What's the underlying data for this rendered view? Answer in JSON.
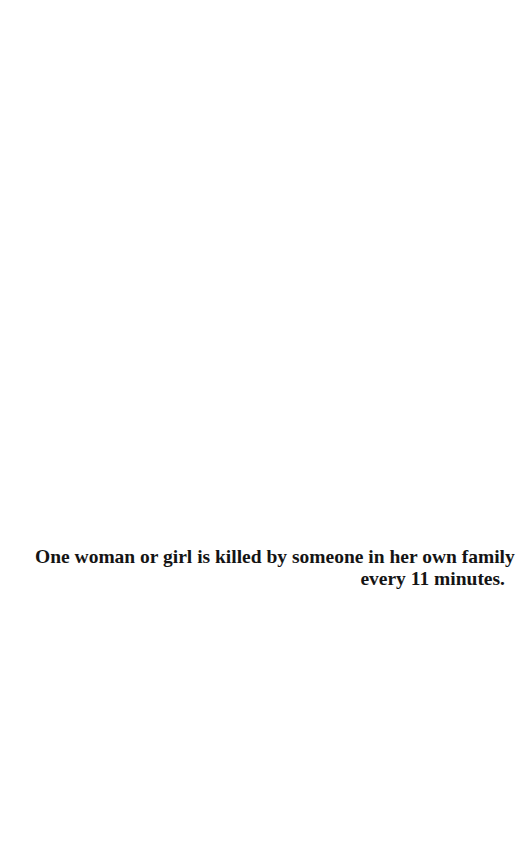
{
  "page": {
    "background": "#ffffff",
    "text_color": "#141414",
    "quote": {
      "lines": [
        "One woman or girl is killed by someone in her own family",
        "every 11 minutes."
      ]
    }
  }
}
